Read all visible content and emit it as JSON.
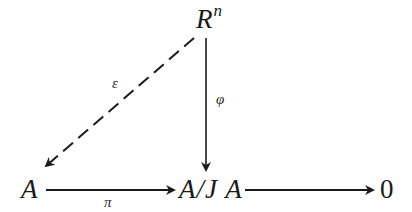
{
  "diagram": {
    "type": "commutative-diagram",
    "nodes": {
      "Rn": {
        "base": "R",
        "sup": "n"
      },
      "A": "A",
      "AJA": "A/J A",
      "zero": "0"
    },
    "edges": [
      {
        "from": "A",
        "to": "A/JA",
        "label": "π",
        "style": "solid"
      },
      {
        "from": "A/JA",
        "to": "0",
        "label": "",
        "style": "solid"
      },
      {
        "from": "Rn",
        "to": "A/JA",
        "label": "φ",
        "style": "solid"
      },
      {
        "from": "Rn",
        "to": "A",
        "label": "ε",
        "style": "dashed"
      }
    ],
    "labels": {
      "pi": "π",
      "phi": "φ",
      "epsilon": "ε"
    },
    "colors": {
      "stroke": "#1a1a1a",
      "background": "#ffffff"
    }
  }
}
